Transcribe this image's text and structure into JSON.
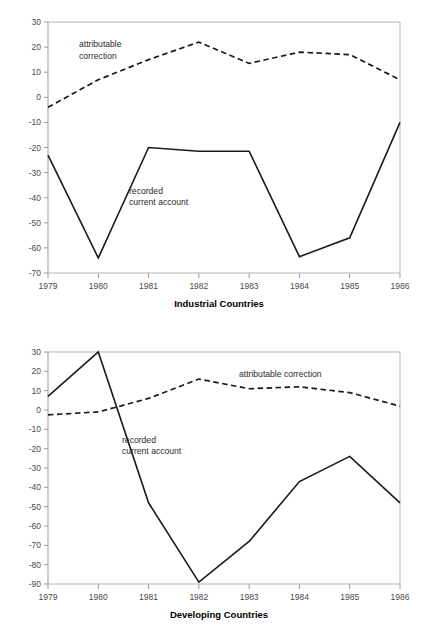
{
  "figure": {
    "title_fragment": "",
    "background": "#ffffff",
    "line_color": "#1a1a1a",
    "axis_color": "#9a9a9a"
  },
  "chart_data": [
    {
      "id": "industrial-countries",
      "type": "line",
      "title": "",
      "caption": "Industrial Countries",
      "xlabel": "",
      "ylabel": "",
      "grid": false,
      "legend": "inline-annotations",
      "x": [
        "1979",
        "1980",
        "1981",
        "1982",
        "1983",
        "1984",
        "1985",
        "1986"
      ],
      "xticklabels": [
        "1979",
        "1980",
        "1981",
        "1982",
        "1983",
        "1984",
        "1985",
        "1986"
      ],
      "yticks": [
        30,
        20,
        10,
        0,
        -10,
        -20,
        -30,
        -40,
        -50,
        -60,
        -70
      ],
      "yticklabels": [
        "30",
        "20",
        "10",
        "0",
        "-10",
        "-20",
        "-30",
        "-40",
        "-50",
        "-60",
        "-70"
      ],
      "ylim": [
        -70,
        30
      ],
      "series": [
        {
          "name": "attributable correction",
          "style": "dashed",
          "label_line1": "attributable",
          "label_line2": "correction",
          "values": [
            -4,
            7,
            15,
            22,
            13.5,
            18,
            17,
            7
          ]
        },
        {
          "name": "recorded current account",
          "style": "solid",
          "label_line1": "recorded",
          "label_line2": "current account",
          "values": [
            -23,
            -64,
            -20,
            -21.5,
            -21.5,
            -63.5,
            -56,
            -10
          ]
        }
      ]
    },
    {
      "id": "developing-countries",
      "type": "line",
      "title": "",
      "caption": "Developing Countries",
      "xlabel": "",
      "ylabel": "",
      "grid": false,
      "legend": "inline-annotations",
      "x": [
        "1979",
        "1980",
        "1981",
        "1982",
        "1983",
        "1984",
        "1985",
        "1986"
      ],
      "xticklabels": [
        "1979",
        "1980",
        "1981",
        "1982",
        "1983",
        "1984",
        "1985",
        "1986"
      ],
      "yticks": [
        30,
        20,
        10,
        0,
        -10,
        -20,
        -30,
        -40,
        -50,
        -60,
        -70,
        -80,
        -90
      ],
      "yticklabels": [
        "30",
        "20",
        "10",
        "0",
        "-10",
        "-20",
        "-30",
        "-40",
        "-50",
        "-60",
        "-70",
        "-80",
        "-90"
      ],
      "ylim": [
        -90,
        30
      ],
      "series": [
        {
          "name": "attributable correction",
          "style": "dashed",
          "label_line1": "attributable correction",
          "label_line2": "",
          "values": [
            -2.5,
            -1,
            6,
            16,
            11,
            12,
            9,
            2
          ]
        },
        {
          "name": "recorded current account",
          "style": "solid",
          "label_line1": "recorded",
          "label_line2": "current account",
          "values": [
            7,
            30,
            -48,
            -89,
            -68,
            -37,
            -24,
            -48
          ]
        }
      ]
    }
  ]
}
